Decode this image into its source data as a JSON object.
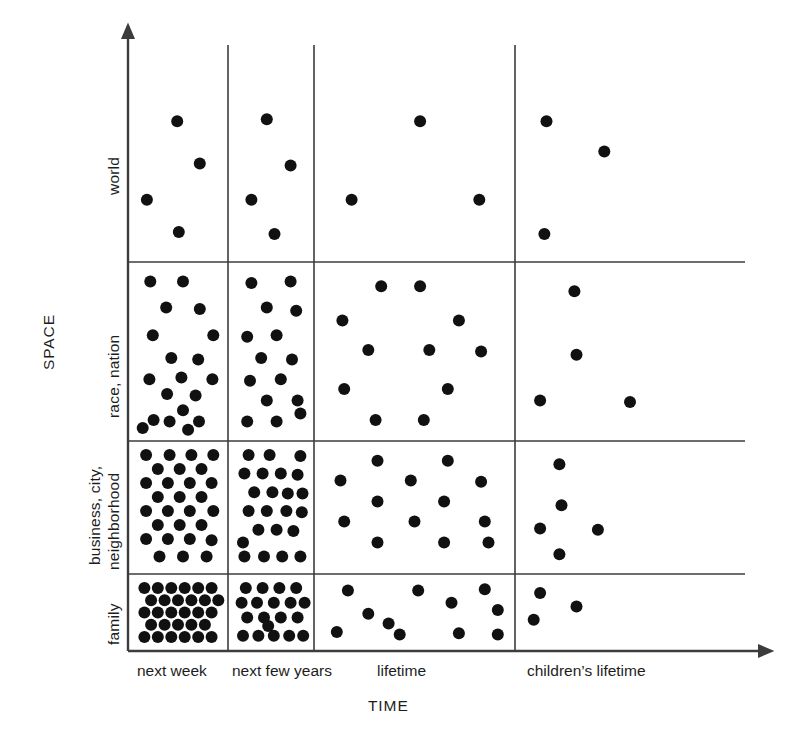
{
  "figure": {
    "type": "density-matrix",
    "background": "#ffffff",
    "ink_color": "#111111",
    "axis_color": "#3c3c3c"
  },
  "axes": {
    "y_title": "SPACE",
    "x_title": "TIME",
    "y_categories": [
      {
        "id": "world",
        "label": "world",
        "lines": [
          "world"
        ]
      },
      {
        "id": "race-nation",
        "label": "race, nation",
        "lines": [
          "race, nation"
        ]
      },
      {
        "id": "business-city-neighborhood",
        "label": "business, city, neighborhood",
        "lines": [
          "business, city,",
          "neighborhood"
        ]
      },
      {
        "id": "family",
        "label": "family",
        "lines": [
          "family"
        ]
      }
    ],
    "x_categories": [
      {
        "id": "next-week",
        "label": "next week"
      },
      {
        "id": "next-few-years",
        "label": "next few years"
      },
      {
        "id": "lifetime",
        "label": "lifetime"
      },
      {
        "id": "childrens-lifetime",
        "label": "children’s lifetime"
      }
    ]
  },
  "chart_data": {
    "type": "scatter",
    "title": "",
    "xlabel": "TIME",
    "ylabel": "SPACE",
    "grid": true,
    "legend": "none",
    "categories_x": [
      "next week",
      "next few years",
      "lifetime",
      "children's lifetime"
    ],
    "categories_y": [
      "world",
      "race, nation",
      "business, city, neighborhood",
      "family"
    ],
    "counts": [
      {
        "y": "world",
        "values": [
          4,
          4,
          3,
          3
        ]
      },
      {
        "y": "race, nation",
        "values": [
          19,
          15,
          11,
          4
        ]
      },
      {
        "y": "business, city, neighborhood",
        "values": [
          28,
          22,
          13,
          5
        ]
      },
      {
        "y": "family",
        "values": [
          28,
          19,
          11,
          3
        ]
      }
    ],
    "cells": [
      {
        "row": "world",
        "col": "next week",
        "n": 4,
        "points": [
          [
            0.49,
            0.34
          ],
          [
            0.76,
            0.55
          ],
          [
            0.13,
            0.73
          ],
          [
            0.51,
            0.89
          ]
        ]
      },
      {
        "row": "world",
        "col": "next few years",
        "n": 4,
        "points": [
          [
            0.44,
            0.33
          ],
          [
            0.78,
            0.56
          ],
          [
            0.22,
            0.73
          ],
          [
            0.55,
            0.9
          ]
        ]
      },
      {
        "row": "world",
        "col": "lifetime",
        "n": 3,
        "points": [
          [
            0.53,
            0.34
          ],
          [
            0.16,
            0.73
          ],
          [
            0.85,
            0.73
          ]
        ]
      },
      {
        "row": "world",
        "col": "children's lifetime",
        "n": 3,
        "points": [
          [
            0.11,
            0.34
          ],
          [
            0.38,
            0.49
          ],
          [
            0.1,
            0.9
          ]
        ]
      },
      {
        "row": "race, nation",
        "col": "next week",
        "n": 19,
        "points": [
          [
            0.17,
            0.07
          ],
          [
            0.56,
            0.07
          ],
          [
            0.36,
            0.23
          ],
          [
            0.76,
            0.24
          ],
          [
            0.2,
            0.4
          ],
          [
            0.92,
            0.4
          ],
          [
            0.42,
            0.54
          ],
          [
            0.74,
            0.55
          ],
          [
            0.16,
            0.67
          ],
          [
            0.54,
            0.66
          ],
          [
            0.91,
            0.67
          ],
          [
            0.37,
            0.76
          ],
          [
            0.71,
            0.77
          ],
          [
            0.56,
            0.86
          ],
          [
            0.21,
            0.92
          ],
          [
            0.4,
            0.93
          ],
          [
            0.75,
            0.93
          ],
          [
            0.08,
            0.97
          ],
          [
            0.62,
            0.98
          ]
        ]
      },
      {
        "row": "race, nation",
        "col": "next few years",
        "n": 15,
        "points": [
          [
            0.22,
            0.08
          ],
          [
            0.78,
            0.07
          ],
          [
            0.44,
            0.23
          ],
          [
            0.86,
            0.25
          ],
          [
            0.16,
            0.41
          ],
          [
            0.58,
            0.4
          ],
          [
            0.36,
            0.54
          ],
          [
            0.8,
            0.55
          ],
          [
            0.2,
            0.68
          ],
          [
            0.64,
            0.67
          ],
          [
            0.44,
            0.8
          ],
          [
            0.88,
            0.8
          ],
          [
            0.16,
            0.93
          ],
          [
            0.58,
            0.93
          ],
          [
            0.92,
            0.88
          ]
        ]
      },
      {
        "row": "race, nation",
        "col": "lifetime",
        "n": 11,
        "points": [
          [
            0.32,
            0.1
          ],
          [
            0.53,
            0.1
          ],
          [
            0.11,
            0.31
          ],
          [
            0.74,
            0.31
          ],
          [
            0.25,
            0.49
          ],
          [
            0.58,
            0.49
          ],
          [
            0.86,
            0.5
          ],
          [
            0.12,
            0.73
          ],
          [
            0.68,
            0.73
          ],
          [
            0.29,
            0.92
          ],
          [
            0.55,
            0.92
          ]
        ]
      },
      {
        "row": "race, nation",
        "col": "children's lifetime",
        "n": 4,
        "points": [
          [
            0.24,
            0.13
          ],
          [
            0.25,
            0.52
          ],
          [
            0.08,
            0.8
          ],
          [
            0.5,
            0.81
          ]
        ]
      },
      {
        "row": "business, city, neighborhood",
        "col": "next week",
        "n": 28,
        "points": [
          [
            0.12,
            0.05
          ],
          [
            0.4,
            0.05
          ],
          [
            0.66,
            0.05
          ],
          [
            0.92,
            0.05
          ],
          [
            0.26,
            0.17
          ],
          [
            0.52,
            0.17
          ],
          [
            0.78,
            0.17
          ],
          [
            0.12,
            0.29
          ],
          [
            0.38,
            0.29
          ],
          [
            0.64,
            0.29
          ],
          [
            0.9,
            0.29
          ],
          [
            0.26,
            0.41
          ],
          [
            0.52,
            0.41
          ],
          [
            0.78,
            0.41
          ],
          [
            0.12,
            0.53
          ],
          [
            0.38,
            0.53
          ],
          [
            0.64,
            0.53
          ],
          [
            0.92,
            0.53
          ],
          [
            0.26,
            0.65
          ],
          [
            0.52,
            0.65
          ],
          [
            0.78,
            0.65
          ],
          [
            0.12,
            0.77
          ],
          [
            0.38,
            0.77
          ],
          [
            0.64,
            0.77
          ],
          [
            0.9,
            0.78
          ],
          [
            0.28,
            0.92
          ],
          [
            0.56,
            0.92
          ],
          [
            0.84,
            0.92
          ]
        ]
      },
      {
        "row": "business, city, neighborhood",
        "col": "next few years",
        "n": 22,
        "points": [
          [
            0.18,
            0.05
          ],
          [
            0.48,
            0.05
          ],
          [
            0.92,
            0.06
          ],
          [
            0.12,
            0.21
          ],
          [
            0.38,
            0.21
          ],
          [
            0.64,
            0.21
          ],
          [
            0.88,
            0.22
          ],
          [
            0.26,
            0.37
          ],
          [
            0.52,
            0.37
          ],
          [
            0.74,
            0.38
          ],
          [
            0.95,
            0.38
          ],
          [
            0.18,
            0.53
          ],
          [
            0.44,
            0.53
          ],
          [
            0.72,
            0.53
          ],
          [
            0.94,
            0.54
          ],
          [
            0.32,
            0.69
          ],
          [
            0.58,
            0.69
          ],
          [
            0.82,
            0.7
          ],
          [
            0.1,
            0.8
          ],
          [
            0.12,
            0.92
          ],
          [
            0.4,
            0.92
          ],
          [
            0.66,
            0.92
          ],
          [
            0.92,
            0.92
          ]
        ]
      },
      {
        "row": "business, city, neighborhood",
        "col": "lifetime",
        "n": 13,
        "points": [
          [
            0.3,
            0.1
          ],
          [
            0.68,
            0.1
          ],
          [
            0.1,
            0.27
          ],
          [
            0.48,
            0.27
          ],
          [
            0.86,
            0.28
          ],
          [
            0.3,
            0.45
          ],
          [
            0.66,
            0.45
          ],
          [
            0.12,
            0.62
          ],
          [
            0.5,
            0.62
          ],
          [
            0.88,
            0.62
          ],
          [
            0.3,
            0.8
          ],
          [
            0.66,
            0.8
          ],
          [
            0.9,
            0.8
          ]
        ]
      },
      {
        "row": "business, city, neighborhood",
        "col": "children's lifetime",
        "n": 5,
        "points": [
          [
            0.17,
            0.13
          ],
          [
            0.18,
            0.48
          ],
          [
            0.08,
            0.68
          ],
          [
            0.35,
            0.69
          ],
          [
            0.17,
            0.9
          ]
        ]
      },
      {
        "row": "family",
        "col": "next week",
        "n": 28,
        "points": [
          [
            0.1,
            0.1
          ],
          [
            0.26,
            0.1
          ],
          [
            0.42,
            0.1
          ],
          [
            0.58,
            0.1
          ],
          [
            0.74,
            0.1
          ],
          [
            0.9,
            0.1
          ],
          [
            0.18,
            0.3
          ],
          [
            0.34,
            0.3
          ],
          [
            0.5,
            0.3
          ],
          [
            0.66,
            0.3
          ],
          [
            0.82,
            0.3
          ],
          [
            0.98,
            0.3
          ],
          [
            0.1,
            0.5
          ],
          [
            0.26,
            0.5
          ],
          [
            0.42,
            0.5
          ],
          [
            0.58,
            0.5
          ],
          [
            0.74,
            0.5
          ],
          [
            0.9,
            0.5
          ],
          [
            0.18,
            0.7
          ],
          [
            0.34,
            0.7
          ],
          [
            0.5,
            0.7
          ],
          [
            0.66,
            0.7
          ],
          [
            0.82,
            0.7
          ],
          [
            0.1,
            0.9
          ],
          [
            0.26,
            0.9
          ],
          [
            0.42,
            0.9
          ],
          [
            0.58,
            0.9
          ],
          [
            0.74,
            0.9
          ],
          [
            0.9,
            0.9
          ]
        ]
      },
      {
        "row": "family",
        "col": "next few years",
        "n": 19,
        "points": [
          [
            0.14,
            0.1
          ],
          [
            0.38,
            0.1
          ],
          [
            0.62,
            0.1
          ],
          [
            0.86,
            0.1
          ],
          [
            0.08,
            0.34
          ],
          [
            0.3,
            0.34
          ],
          [
            0.54,
            0.34
          ],
          [
            0.78,
            0.34
          ],
          [
            0.98,
            0.34
          ],
          [
            0.16,
            0.58
          ],
          [
            0.4,
            0.58
          ],
          [
            0.64,
            0.58
          ],
          [
            0.88,
            0.58
          ],
          [
            0.1,
            0.88
          ],
          [
            0.32,
            0.88
          ],
          [
            0.54,
            0.88
          ],
          [
            0.76,
            0.88
          ],
          [
            0.96,
            0.88
          ],
          [
            0.46,
            0.72
          ]
        ]
      },
      {
        "row": "family",
        "col": "lifetime",
        "n": 11,
        "points": [
          [
            0.14,
            0.14
          ],
          [
            0.52,
            0.14
          ],
          [
            0.88,
            0.12
          ],
          [
            0.7,
            0.34
          ],
          [
            0.25,
            0.52
          ],
          [
            0.08,
            0.82
          ],
          [
            0.42,
            0.86
          ],
          [
            0.74,
            0.84
          ],
          [
            0.95,
            0.46
          ],
          [
            0.36,
            0.68
          ],
          [
            0.95,
            0.86
          ]
        ]
      },
      {
        "row": "family",
        "col": "children's lifetime",
        "n": 3,
        "points": [
          [
            0.08,
            0.18
          ],
          [
            0.25,
            0.4
          ],
          [
            0.05,
            0.62
          ]
        ]
      }
    ]
  },
  "geometry": {
    "plot_left": 128,
    "plot_right": 745,
    "plot_top": 45,
    "plot_bottom": 651,
    "v_dividers": [
      228,
      314,
      515
    ],
    "h_dividers": [
      262,
      441,
      574
    ],
    "dot_radius": 6.0
  }
}
